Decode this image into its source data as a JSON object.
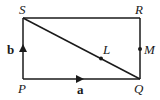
{
  "diagram": {
    "type": "rectangle-vectors",
    "vertices": {
      "P": {
        "label": "P",
        "x": 23,
        "y": 79
      },
      "Q": {
        "label": "Q",
        "x": 140,
        "y": 79
      },
      "R": {
        "label": "R",
        "x": 140,
        "y": 18
      },
      "S": {
        "label": "S",
        "x": 23,
        "y": 18
      }
    },
    "points": {
      "L": {
        "label": "L",
        "x": 101,
        "y": 58,
        "on": "SQ"
      },
      "M": {
        "label": "M",
        "x": 140,
        "y": 49,
        "on": "QR"
      }
    },
    "vectors": {
      "a": {
        "label": "a",
        "from": "P",
        "to": "Q"
      },
      "b": {
        "label": "b",
        "from": "P",
        "to": "S"
      }
    },
    "segments": [
      "PQ",
      "QR",
      "RS",
      "SP",
      "SQ"
    ],
    "stroke_color": "#1a1a1a"
  }
}
